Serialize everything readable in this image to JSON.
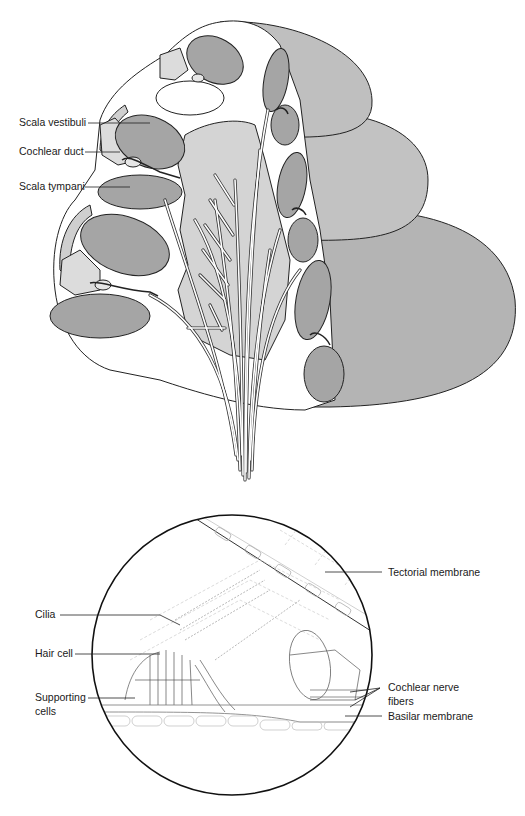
{
  "figure": {
    "top_panel": {
      "name": "cochlea cross-section",
      "labels": {
        "scala_vestibuli": "Scala vestibuli",
        "cochlear_duct": "Cochlear duct",
        "scala_tympani": "Scala tympani"
      }
    },
    "bottom_panel": {
      "name": "organ of Corti magnified view",
      "labels": {
        "tectorial_membrane": "Tectorial membrane",
        "cilia": "Cilia",
        "hair_cell": "Hair cell",
        "supporting_cells_line1": "Supporting",
        "supporting_cells_line2": "cells",
        "cochlear_nerve_fibers_line1": "Cochlear nerve",
        "cochlear_nerve_fibers_line2": "fibers",
        "basilar_membrane": "Basilar membrane"
      }
    },
    "colors": {
      "dark_gray": "#a3a3a3",
      "light_gray": "#cfcfcf",
      "lobe_gray": "#b9b9b9",
      "outline": "#222222"
    }
  }
}
